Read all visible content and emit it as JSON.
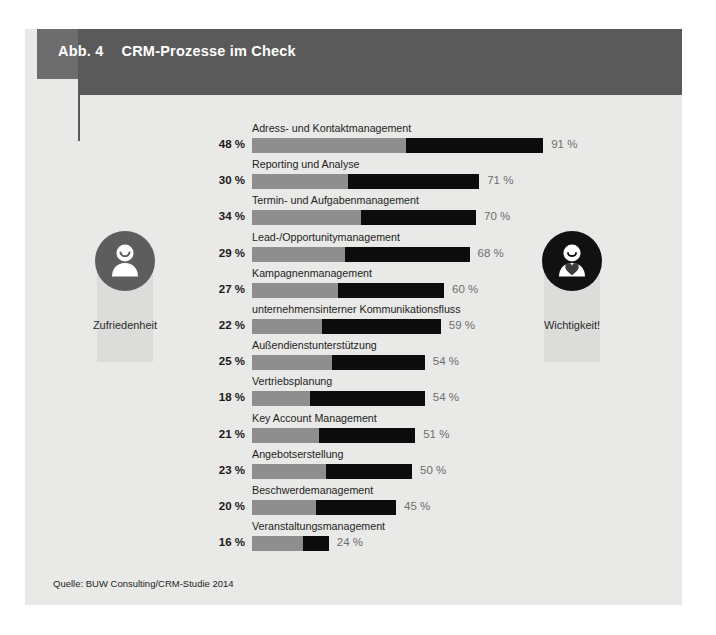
{
  "figure": {
    "number_label": "Abb. 4",
    "title": "CRM-Prozesse im Check",
    "source": "Quelle: BUW Consulting/CRM-Studie 2014"
  },
  "legend": {
    "left": {
      "label": "Zufriedenheit",
      "icon": "person-smile-icon",
      "color": "#5d5d5d"
    },
    "right": {
      "label": "Wichtigkeit!",
      "icon": "person-heart-icon",
      "color": "#111111"
    }
  },
  "colors": {
    "satisfaction_bar": "#8e8e8e",
    "importance_bar": "#0c0c0c",
    "header_band": "#5a5a5a",
    "panel_background": "#e9e9e7"
  },
  "chart_data": {
    "type": "bar",
    "title": "CRM-Prozesse im Check",
    "subtitle": "",
    "orientation": "horizontal",
    "xlabel": "",
    "ylabel": "",
    "xlim": [
      0,
      91
    ],
    "grid": false,
    "legend_position": "sides",
    "unit": "%",
    "categories": [
      "Adress- und Kontaktmanagement",
      "Reporting und Analyse",
      "Termin- und Aufgabenmanagement",
      "Lead-/Opportunitymanagement",
      "Kampagnenmanagement",
      "unternehmensinterner Kommunikationsfluss",
      "Außendienstunterstützung",
      "Vertriebsplanung",
      "Key Account Management",
      "Angebotserstellung",
      "Beschwerdemanagement",
      "Veranstaltungsmanagement"
    ],
    "series": [
      {
        "name": "Zufriedenheit",
        "color": "#8e8e8e",
        "values": [
          48,
          30,
          34,
          29,
          27,
          22,
          25,
          18,
          21,
          23,
          20,
          16
        ],
        "value_labels": [
          "48 %",
          "30 %",
          "34 %",
          "29 %",
          "27 %",
          "22 %",
          "25 %",
          "18 %",
          "21 %",
          "23 %",
          "20 %",
          "16 %"
        ]
      },
      {
        "name": "Wichtigkeit!",
        "color": "#0c0c0c",
        "values": [
          91,
          71,
          70,
          68,
          60,
          59,
          54,
          54,
          51,
          50,
          45,
          24
        ],
        "value_labels": [
          "91 %",
          "71 %",
          "70 %",
          "68 %",
          "60 %",
          "59 %",
          "54 %",
          "54 %",
          "51 %",
          "50 %",
          "45 %",
          "24 %"
        ]
      }
    ]
  }
}
